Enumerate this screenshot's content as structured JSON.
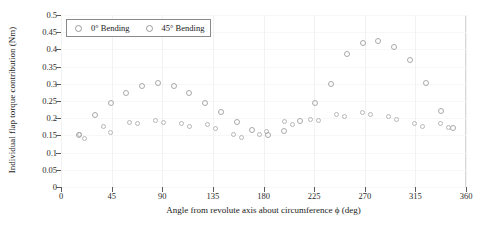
{
  "chart_data": {
    "type": "scatter",
    "title": "",
    "xlabel": "Angle from revolute axis about circumference  ϕ  (deg)",
    "ylabel": "Individual flap torque contribution (Nm)",
    "xlim": [
      0,
      360
    ],
    "ylim": [
      0,
      0.5
    ],
    "xticks": [
      0,
      45,
      90,
      135,
      180,
      225,
      270,
      315,
      360
    ],
    "xtick_labels": [
      "0",
      "45",
      "90",
      "135",
      "180",
      "225",
      "270",
      "315",
      "360"
    ],
    "yticks": [
      0,
      0.05,
      0.1,
      0.15,
      0.2,
      0.25,
      0.3,
      0.35,
      0.4,
      0.45,
      0.5
    ],
    "ytick_labels": [
      "0",
      "0.05",
      "0.1",
      "0.15",
      "0.2",
      "0.25",
      "0.3",
      "0.35",
      "0.4",
      "0.45",
      "0.5"
    ],
    "grid": false,
    "legend_position": "top-left",
    "marker": "open-circle",
    "series": [
      {
        "name": "0° Bending",
        "marker_color": "#b6b6b6",
        "x": [
          16,
          21,
          38,
          44,
          61,
          68,
          84,
          91,
          107,
          114,
          130,
          137,
          153,
          160,
          176,
          183,
          199,
          206,
          222,
          229,
          245,
          252,
          268,
          275,
          291,
          298,
          314,
          321,
          337,
          344
        ],
        "y": [
          0.152,
          0.142,
          0.175,
          0.158,
          0.187,
          0.186,
          0.193,
          0.187,
          0.186,
          0.175,
          0.183,
          0.17,
          0.152,
          0.143,
          0.152,
          0.16,
          0.19,
          0.183,
          0.196,
          0.193,
          0.212,
          0.205,
          0.217,
          0.212,
          0.205,
          0.196,
          0.186,
          0.175,
          0.186,
          0.172
        ]
      },
      {
        "name": "45° Bending",
        "marker_color": "#a9a9a9",
        "x": [
          16,
          30,
          44,
          58,
          72,
          86,
          100,
          114,
          128,
          142,
          156,
          170,
          184,
          198,
          212,
          226,
          240,
          254,
          268,
          282,
          296,
          310,
          324,
          338,
          348
        ],
        "y": [
          0.152,
          0.208,
          0.245,
          0.272,
          0.293,
          0.302,
          0.294,
          0.272,
          0.244,
          0.217,
          0.19,
          0.165,
          0.152,
          0.163,
          0.192,
          0.243,
          0.3,
          0.387,
          0.42,
          0.425,
          0.408,
          0.37,
          0.302,
          0.22,
          0.172
        ]
      }
    ]
  },
  "legend": {
    "entries": [
      {
        "label": "0° Bending",
        "marker": "open-circle-icon"
      },
      {
        "label": "45° Bending",
        "marker": "open-circle-icon"
      }
    ]
  },
  "colors": {
    "axis": "#5a5a5a",
    "text": "#1a1a1a",
    "background": "#ffffff",
    "series_0": "#b6b6b6",
    "series_45": "#a9a9a9"
  }
}
